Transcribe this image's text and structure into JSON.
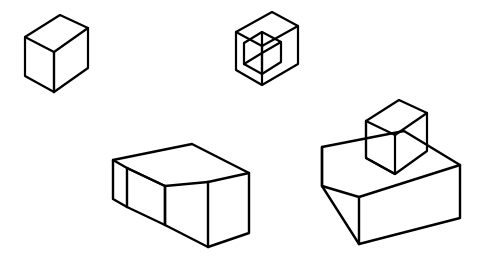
{
  "page": {
    "background_color": "#ffffff",
    "stroke_color": "#000000",
    "face_fill_color": "#ffffff",
    "width": 480,
    "height": 271
  },
  "figures": [
    {
      "id": "figure-1",
      "name": "single-cube",
      "label": "Single cube",
      "description": "A single unit cube drawn in isometric projection, top-left of the image.",
      "cube_count": 1,
      "stroke_width": 2.2,
      "faces": {
        "top": "25,37 60,15 88,28 54,52",
        "left": "25,37 54,52 54,92 25,76",
        "right": "54,52 88,28 88,68 54,92"
      },
      "edges": [
        "M25,37 L60,15 L88,28 L54,52 Z",
        "M25,37 L25,76 L54,92 L54,52",
        "M54,92 L88,68 L88,28",
        "M54,52 L54,92"
      ]
    },
    {
      "id": "figure-2",
      "name": "notched-cube",
      "label": "Cube with a square notch removed from the front-top corner",
      "description": "A unit cube with one smaller cubic bite removed at the near upper corner, revealing two interior faces and an interior floor.",
      "cube_count": 1,
      "stroke_width": 2.2,
      "faces": {
        "outer_top": "236,32 272,12 298,26 262,46",
        "outer_left": "236,32 236,70 262,85 262,46",
        "outer_right": "262,46 298,26 298,64 262,85"
      },
      "edges": [
        "M236,32 L272,12 L298,26 L298,64 L262,85 L236,70 Z",
        "M236,32 L262,46 L298,26",
        "M262,46 L262,85",
        "M244,43 L244,64 L262,74",
        "M244,43 L262,32 L281,42 L281,62 L262,74",
        "M262,32 L262,53 L244,64",
        "M262,53 L281,42",
        "M262,53 L262,74"
      ]
    },
    {
      "id": "figure-3",
      "name": "l-shaped-block",
      "label": "L-shaped block of three cubes",
      "description": "A flat L-shaped (corner) solid formed by three unit cubes lying in one layer, with an inner reentrant corner facing the viewer.",
      "cube_count": 3,
      "stroke_width": 2.4,
      "faces": {
        "top": "113,160 192,144 249,173 208,182 209,216 165,225 113,199",
        "left": "113,160 113,199 127,207 127,168",
        "right": "208,182 249,173 249,233 208,247"
      },
      "edges": [
        "M113,160 L192,144 L249,173 L249,233 L208,247 L165,225 L165,186 L127,168 L127,207 L113,199 Z",
        "M113,160 L127,168",
        "M127,168 L165,186 L208,182",
        "M165,186 L165,225",
        "M208,182 L249,173",
        "M208,182 L208,247",
        "M127,207 L165,225"
      ]
    },
    {
      "id": "figure-4",
      "name": "block-with-cube-on-top",
      "label": "Rectangular base block with a single cube on top",
      "description": "A wide flat rectangular slab in isometric view with one unit cube standing on its upper surface, offset toward the back-right.",
      "cube_count": 5,
      "stroke_width": 2.4,
      "stroke_width_top_cube": 2.2,
      "faces": {
        "base_top": "322,147 404,131 460,165 424,186 359,197",
        "base_left": "322,147 322,186 359,244 359,197",
        "base_right": "359,197 460,165 460,218 359,244",
        "cube_top": "366,121 399,100 427,113 395,135",
        "cube_left": "366,121 366,158 395,174 395,135",
        "cube_right": "395,135 427,113 427,151 395,174"
      },
      "edges": [
        "M322,147 L404,131 L460,165 L460,218 L359,244 L322,186 Z",
        "M322,147 L322,186",
        "M322,186 L359,197 L460,165",
        "M359,197 L359,244",
        "M366,121 L399,100 L427,113 L427,151 L395,174 L366,158 Z",
        "M366,121 L366,158",
        "M366,158 L395,174",
        "M366,121 L395,135 L427,113",
        "M395,135 L395,174"
      ]
    }
  ]
}
